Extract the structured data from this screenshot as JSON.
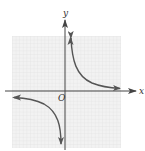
{
  "diagram": {
    "type": "graph-of-function",
    "axes": {
      "x_label": "x",
      "y_label": "y",
      "origin_label": "O"
    },
    "grid": {
      "visible": true,
      "color": "#e6e6e6",
      "background": "#f1f1f1"
    },
    "curve": {
      "color": "#555555",
      "branches": [
        {
          "name": "quadrant-I-branch",
          "direction": "both-ends-arrowed"
        },
        {
          "name": "quadrant-III-branch",
          "direction": "both-ends-arrowed"
        }
      ]
    },
    "colors": {
      "axis": "#444444",
      "curve": "#555555",
      "label": "#333333"
    }
  }
}
